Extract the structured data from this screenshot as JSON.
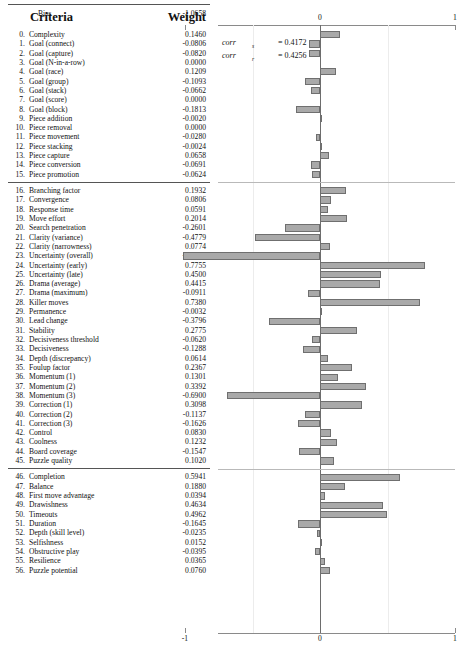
{
  "table": {
    "headers": {
      "criteria": "Criteria",
      "weight": "Weight"
    },
    "bias_label": "Bias",
    "bias_value": "-1.0658",
    "bias_value_num": -1.0658
  },
  "annotation": {
    "lines": [
      {
        "name": "corr",
        "sub": "s",
        "eq": "= 0.4172",
        "value": 0.4172
      },
      {
        "name": "corr",
        "sub": "r",
        "eq": "= 0.4256",
        "value": 0.4256
      }
    ]
  },
  "chart_data": {
    "type": "bar",
    "orientation": "horizontal",
    "title": "",
    "xlabel": "",
    "ylabel": "",
    "xlim": [
      -1,
      1
    ],
    "xticks": [
      -1,
      0,
      1
    ],
    "xticklabels": [
      "-1",
      "0",
      "1"
    ],
    "gridlines": [
      -0.5,
      0.5
    ],
    "grid": true,
    "legend": null,
    "bar_color": "#a9a9a9",
    "bar_edge_color": "#6f6f6f",
    "zero_line_color": "#6d6d6d",
    "group_breaks_after": [
      15,
      45
    ],
    "categories": [
      "Complexity",
      "Goal (connect)",
      "Goal (capture)",
      "Goal (N-in-a-row)",
      "Goal (race)",
      "Goal (group)",
      "Goal (stack)",
      "Goal (score)",
      "Goal (block)",
      "Piece addition",
      "Piece removal",
      "Piece movement",
      "Piece stacking",
      "Piece capture",
      "Piece conversion",
      "Piece promotion",
      "Branching factor",
      "Convergence",
      "Response time",
      "Move effort",
      "Search penetration",
      "Clarity (variance)",
      "Clarity (narrowness)",
      "Uncertainty (overall)",
      "Uncertainty (early)",
      "Uncertainty (late)",
      "Drama (average)",
      "Drama (maximum)",
      "Killer moves",
      "Permanence",
      "Lead change",
      "Stability",
      "Decisiveness threshold",
      "Decisiveness",
      "Depth (discrepancy)",
      "Foulup factor",
      "Momentum (1)",
      "Momentum (2)",
      "Momentum (3)",
      "Correction (1)",
      "Correction (2)",
      "Correction (3)",
      "Control",
      "Coolness",
      "Board coverage",
      "Puzzle quality",
      "Completion",
      "Balance",
      "First move advantage",
      "Drawishness",
      "Timeouts",
      "Duration",
      "Depth (skill level)",
      "Selfishness",
      "Obstructive play",
      "Resilience",
      "Puzzle potential"
    ],
    "values": [
      0.146,
      -0.0806,
      -0.082,
      0.0,
      0.1209,
      -0.1093,
      -0.0662,
      0.0,
      -0.1813,
      -0.002,
      0.0,
      -0.028,
      -0.0024,
      0.0658,
      -0.0691,
      -0.0624,
      0.1932,
      0.0806,
      0.0591,
      0.2014,
      -0.2601,
      -0.4779,
      0.0774,
      -1.0133,
      0.7755,
      0.45,
      0.4415,
      -0.0911,
      0.738,
      -0.0032,
      -0.3796,
      0.2775,
      -0.062,
      -0.1288,
      0.0614,
      0.2367,
      0.1301,
      0.3392,
      -0.69,
      0.3098,
      -0.1137,
      -0.1626,
      0.083,
      0.1232,
      -0.1547,
      0.102,
      0.5941,
      0.188,
      0.0394,
      0.4634,
      0.4962,
      -0.1645,
      -0.0235,
      0.0152,
      -0.0395,
      0.0365,
      0.076
    ],
    "value_labels": [
      "0.1460",
      "-0.0806",
      "-0.0820",
      "0.0000",
      "0.1209",
      "-0.1093",
      "-0.0662",
      "0.0000",
      "-0.1813",
      "-0.0020",
      "0.0000",
      "-0.0280",
      "-0.0024",
      "0.0658",
      "-0.0691",
      "-0.0624",
      "0.1932",
      "0.0806",
      "0.0591",
      "0.2014",
      "-0.2601",
      "-0.4779",
      "0.0774",
      "-1.0133",
      "0.7755",
      "0.4500",
      "0.4415",
      "-0.0911",
      "0.7380",
      "-0.0032",
      "-0.3796",
      "0.2775",
      "-0.0620",
      "-0.1288",
      "0.0614",
      "0.2367",
      "0.1301",
      "0.3392",
      "-0.6900",
      "0.3098",
      "-0.1137",
      "-0.1626",
      "0.0830",
      "0.1232",
      "-0.1547",
      "0.1020",
      "0.5941",
      "0.1880",
      "0.0394",
      "0.4634",
      "0.4962",
      "-0.1645",
      "-0.0235",
      "0.0152",
      "-0.0395",
      "0.0365",
      "0.0760"
    ],
    "index_labels": [
      "0.",
      "1.",
      "2.",
      "3.",
      "4.",
      "5.",
      "6.",
      "7.",
      "8.",
      "9.",
      "10.",
      "11.",
      "12.",
      "13.",
      "14.",
      "15.",
      "16.",
      "17.",
      "18.",
      "19.",
      "20.",
      "21.",
      "22.",
      "23.",
      "24.",
      "25.",
      "26.",
      "27.",
      "28.",
      "29.",
      "30.",
      "31.",
      "32.",
      "33.",
      "34.",
      "35.",
      "36.",
      "37.",
      "38.",
      "39.",
      "40.",
      "41.",
      "42.",
      "43.",
      "44.",
      "45.",
      "46.",
      "47.",
      "48.",
      "49.",
      "50.",
      "51.",
      "52.",
      "53.",
      "54.",
      "55.",
      "56."
    ]
  }
}
